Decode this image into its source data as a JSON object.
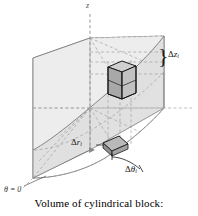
{
  "figure": {
    "caption": "Volume of cylindrical block:",
    "axis_label_z": "z",
    "angle_origin_label": "θ = 0",
    "brace_glyph": "}",
    "labels": {
      "delta_z": {
        "delta": "Δ",
        "variable": "z",
        "subscript": "i"
      },
      "delta_r": {
        "delta": "Δ",
        "variable": "r",
        "subscript": "i"
      },
      "delta_theta": {
        "delta": "Δ",
        "variable": "θ",
        "subscript": "i"
      }
    },
    "colors": {
      "wedge_left_face": "#e4e4e4",
      "wedge_right_face": "#dcdcdc",
      "wedge_top_face": "#ebebeb",
      "outline": "#5a5a5a",
      "dashed_guide": "#9a9a9a",
      "block_dark_edge": "#1b1b1b",
      "block_fill_light": "#c9c9c9",
      "block_fill_dark": "#9e9e9e",
      "text": "#111111",
      "background": "#ffffff"
    }
  }
}
